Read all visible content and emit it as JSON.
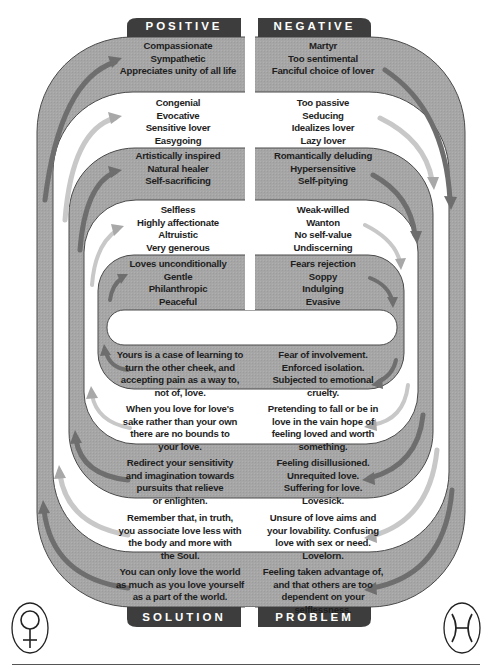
{
  "colors": {
    "band_gray": "#a6a6a6",
    "band_outline": "#4a4a4a",
    "tab_dark": "#3d3d3d",
    "white_band": "#ffffff",
    "arrow_dark": "#6e6e6e",
    "arrow_light": "#c8c8c8"
  },
  "tabs": {
    "top_left": "POSITIVE",
    "top_right": "NEGATIVE",
    "bottom_left": "SOLUTION",
    "bottom_right": "PROBLEM"
  },
  "positive": [
    {
      "lines": [
        "Compassionate",
        "Sympathetic",
        "Appreciates unity of all life"
      ]
    },
    {
      "lines": [
        "Congenial",
        "Evocative",
        "Sensitive lover",
        "Easygoing"
      ]
    },
    {
      "lines": [
        "Artistically inspired",
        "Natural healer",
        "Self-sacrificing"
      ]
    },
    {
      "lines": [
        "Selfless",
        "Highly affectionate",
        "Altruistic",
        "Very generous"
      ]
    },
    {
      "lines": [
        "Loves unconditionally",
        "Gentle",
        "Philanthropic",
        "Peaceful"
      ]
    }
  ],
  "negative": [
    {
      "lines": [
        "Martyr",
        "Too sentimental",
        "Fanciful choice of lover"
      ]
    },
    {
      "lines": [
        "Too passive",
        "Seducing",
        "Idealizes lover",
        "Lazy lover"
      ]
    },
    {
      "lines": [
        "Romantically deluding",
        "Hypersensitive",
        "Self-pitying"
      ]
    },
    {
      "lines": [
        "Weak-willed",
        "Wanton",
        "No self-value",
        "Undiscerning"
      ]
    },
    {
      "lines": [
        "Fears rejection",
        "Soppy",
        "Indulging",
        "Evasive"
      ]
    }
  ],
  "solution": [
    {
      "lines": [
        "Yours is a case of learning to",
        "turn the other cheek, and",
        "accepting pain as a way to,",
        "not of, love."
      ]
    },
    {
      "lines": [
        "When you love for love's",
        "sake rather than your own",
        "there are no bounds to",
        "your love."
      ]
    },
    {
      "lines": [
        "Redirect your sensitivity",
        "and imagination towards",
        "pursuits that relieve",
        "or enlighten."
      ]
    },
    {
      "lines": [
        "Remember that, in truth,",
        "you associate love less with",
        "the body and more with",
        "the Soul."
      ]
    },
    {
      "lines": [
        "You can only love the world",
        "as much as you love yourself",
        "as a part of the world."
      ]
    }
  ],
  "problem": [
    {
      "lines": [
        "Fear of involvement.",
        "Enforced isolation.",
        "Subjected to emotional",
        "cruelty."
      ]
    },
    {
      "lines": [
        "Pretending to fall or be in",
        "love in the vain hope of",
        "feeling loved and worth",
        "something."
      ]
    },
    {
      "lines": [
        "Feeling disillusioned.",
        "Unrequited love.",
        "Suffering for love.",
        "Lovesick."
      ]
    },
    {
      "lines": [
        "Unsure of love aims and",
        "your lovability. Confusing",
        "love with sex or need.",
        "Lovelorn."
      ]
    },
    {
      "lines": [
        "Feeling taken advantage of,",
        "and that others are too",
        "dependent on your",
        "selflessness."
      ]
    }
  ],
  "symbols": {
    "left": "venus-symbol",
    "right": "pisces-symbol"
  }
}
